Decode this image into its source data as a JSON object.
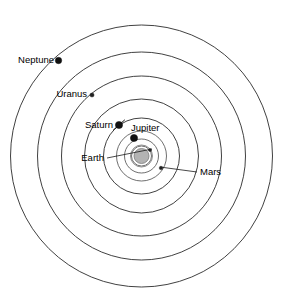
{
  "diagram": {
    "type": "solar-system-orbit-diagram",
    "center": {
      "x": 141.5,
      "y": 156
    },
    "background_color": "#ffffff",
    "orbit_stroke_color": "#2b2b2b",
    "planet_dot_color": "#111111",
    "sun_color": "#b3b3b3"
  },
  "sun": {
    "name": "Sun",
    "radius": 7.5,
    "halo_radius": 11,
    "color": "#b3b3b3"
  },
  "orbits": [
    {
      "name": "Mercury",
      "radius": 10
    },
    {
      "name": "Venus",
      "radius": 17
    },
    {
      "name": "Earth",
      "radius": 25
    },
    {
      "name": "Mars",
      "radius": 38
    },
    {
      "name": "Jupiter",
      "radius": 57
    },
    {
      "name": "Saturn",
      "radius": 80
    },
    {
      "name": "Uranus",
      "radius": 104
    },
    {
      "name": "Neptune",
      "radius": 131
    }
  ],
  "planets": [
    {
      "name": "Neptune",
      "label": "Neptune",
      "dot": {
        "x": 58.5,
        "y": 60.5,
        "r": 3.2
      },
      "label_pos": {
        "x": 54,
        "y": 60
      },
      "label_anchor": "end",
      "has_rings": false,
      "leader": null
    },
    {
      "name": "Uranus",
      "label": "Uranus",
      "dot": {
        "x": 92,
        "y": 95,
        "r": 2.1
      },
      "label_pos": {
        "x": 87,
        "y": 94
      },
      "label_anchor": "end",
      "has_rings": false,
      "leader": null
    },
    {
      "name": "Saturn",
      "label": "Saturn",
      "dot": {
        "x": 119,
        "y": 125,
        "r": 3.6
      },
      "label_pos": {
        "x": 113,
        "y": 125
      },
      "label_anchor": "end",
      "has_rings": true,
      "leader": null
    },
    {
      "name": "Jupiter",
      "label": "Jupiter",
      "dot": {
        "x": 134,
        "y": 138,
        "r": 3.6
      },
      "label_pos": {
        "x": 131,
        "y": 128
      },
      "label_anchor": "start",
      "has_rings": false,
      "leader": null
    },
    {
      "name": "Earth",
      "label": "Earth",
      "dot": {
        "x": 150,
        "y": 150,
        "r": 1.6
      },
      "label_pos": {
        "x": 104,
        "y": 158
      },
      "label_anchor": "end",
      "has_rings": false,
      "leader": {
        "x1": 107,
        "y1": 158,
        "x2": 152,
        "y2": 149
      }
    },
    {
      "name": "Mars",
      "label": "Mars",
      "dot": {
        "x": 161,
        "y": 168,
        "r": 1.8
      },
      "label_pos": {
        "x": 200,
        "y": 172
      },
      "label_anchor": "start",
      "has_rings": false,
      "leader": {
        "x1": 197,
        "y1": 172,
        "x2": 160,
        "y2": 167
      }
    }
  ]
}
